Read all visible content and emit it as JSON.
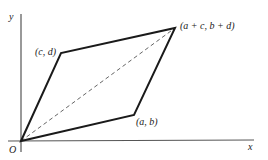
{
  "diagram": {
    "type": "parallelogram-vector-addition",
    "axes": {
      "x_label": "x",
      "y_label": "y",
      "origin_label": "O"
    },
    "points": {
      "origin": {
        "label": "O"
      },
      "cd": {
        "label": "(c, d)"
      },
      "ab": {
        "label": "(a, b)"
      },
      "sum": {
        "label": "(a + c, b + d)"
      }
    },
    "edges": [
      {
        "from": "O",
        "to": "(c, d)",
        "style": "solid"
      },
      {
        "from": "(c, d)",
        "to": "(a + c, b + d)",
        "style": "solid"
      },
      {
        "from": "O",
        "to": "(a, b)",
        "style": "solid"
      },
      {
        "from": "(a, b)",
        "to": "(a + c, b + d)",
        "style": "solid"
      },
      {
        "from": "O",
        "to": "(a + c, b + d)",
        "style": "dashed"
      }
    ],
    "colors": {
      "line": "#1a1a1a",
      "axis": "#555555",
      "dashed": "#666666"
    }
  }
}
